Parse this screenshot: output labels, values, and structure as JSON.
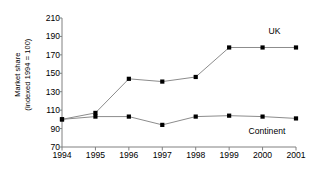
{
  "chart_data": {
    "type": "line",
    "title": "",
    "xlabel": "",
    "ylabel": "Market share (indexed 1994 = 100)",
    "ylabel_lines": [
      "Market share",
      "(indexed 1994 = 100)"
    ],
    "categories": [
      "1994",
      "1995",
      "1996",
      "1997",
      "1998",
      "1999",
      "2000",
      "2001"
    ],
    "x": [
      1994,
      1995,
      1996,
      1997,
      1998,
      1999,
      2000,
      2001
    ],
    "ylim": [
      70,
      210
    ],
    "yticks": [
      70,
      90,
      110,
      130,
      150,
      170,
      190,
      210
    ],
    "ytick_labels": [
      "70",
      "90",
      "110",
      "130",
      "150",
      "170",
      "190",
      "210"
    ],
    "grid": false,
    "legend_position": "inline-right",
    "marker": "square",
    "series": [
      {
        "name": "UK",
        "label": "UK",
        "color": "#000000",
        "values": [
          100,
          107,
          144,
          141,
          146,
          178,
          178,
          178
        ]
      },
      {
        "name": "Continent",
        "label": "Continent",
        "color": "#000000",
        "values": [
          100,
          103,
          103,
          94,
          103,
          104,
          103,
          101
        ]
      }
    ],
    "annotations": [
      {
        "text": "UK",
        "series": "UK"
      },
      {
        "text": "Continent",
        "series": "Continent"
      }
    ]
  },
  "style": {
    "axis_color": "#808080",
    "line_color": "#8c8c8c",
    "marker_color": "#000000",
    "text_color": "#000000",
    "background": "#ffffff"
  }
}
